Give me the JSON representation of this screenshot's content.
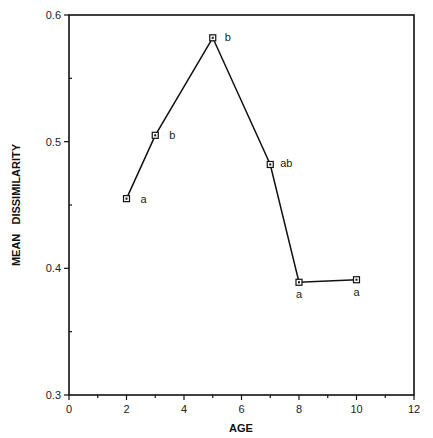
{
  "chart_data": {
    "type": "line",
    "title": "",
    "xlabel": "AGE",
    "ylabel": "MEAN   DISSIMILARITY",
    "xlim": [
      0,
      12
    ],
    "ylim": [
      0.3,
      0.6
    ],
    "xticks": [
      0,
      2,
      4,
      6,
      8,
      10,
      12
    ],
    "xtick_labels": [
      "0",
      "2",
      "4",
      "6",
      "8",
      "10",
      "12"
    ],
    "yticks": [
      0.3,
      0.4,
      0.5,
      0.6
    ],
    "ytick_labels": [
      "0.3",
      "0.4",
      "0.5",
      "0.6"
    ],
    "grid": false,
    "legend": null,
    "series": [
      {
        "name": "Mean dissimilarity",
        "x": [
          2,
          3,
          5,
          7,
          8,
          10
        ],
        "values": [
          0.455,
          0.505,
          0.582,
          0.482,
          0.389,
          0.391
        ],
        "annotations": [
          "a",
          "b",
          "b",
          "ab",
          "a",
          "a"
        ],
        "marker": "square"
      }
    ]
  }
}
